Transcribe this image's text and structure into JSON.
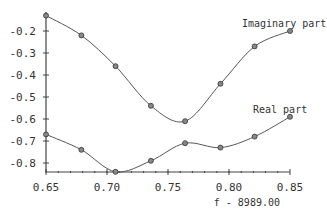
{
  "chart_data": {
    "type": "line",
    "title": "",
    "xlabel": "f - 8989.00",
    "ylabel": "",
    "xlim": [
      0.65,
      0.85
    ],
    "ylim": [
      -0.84,
      -0.13
    ],
    "x_ticks": [
      "0.65",
      "0.70",
      "0.75",
      "0.80",
      "0.85"
    ],
    "y_ticks": [
      "-0.2",
      "-0.3",
      "-0.4",
      "-0.5",
      "-0.6",
      "-0.7",
      "-0.8"
    ],
    "grid": false,
    "x": [
      0.65,
      0.679,
      0.707,
      0.736,
      0.764,
      0.793,
      0.821,
      0.85
    ],
    "series": [
      {
        "name": "Imaginary part",
        "values": [
          -0.13,
          -0.22,
          -0.36,
          -0.54,
          -0.61,
          -0.44,
          -0.27,
          -0.2
        ]
      },
      {
        "name": "Real part",
        "values": [
          -0.67,
          -0.74,
          -0.84,
          -0.79,
          -0.71,
          -0.73,
          -0.68,
          -0.59
        ]
      }
    ]
  }
}
